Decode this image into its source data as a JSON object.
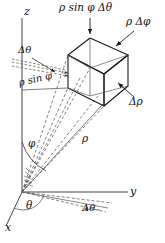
{
  "figure": {
    "type": "spherical-coordinates-volume-element",
    "background_color": "#ffffff",
    "stroke_color": "#1a1a1a",
    "dashed_color": "#555555"
  },
  "axes": {
    "z_label": "z",
    "y_label": "y",
    "x_label": "x"
  },
  "labels": {
    "arc_rho_sin_phi_dtheta": "ρ sin φ Δθ",
    "edge_rho_dphi": "ρ Δφ",
    "edge_drho": "Δρ",
    "angle_dtheta_upper": "Δθ",
    "segment_rho_sin_phi": "ρ sin φ",
    "ray_rho": "ρ",
    "angle_phi": "φ",
    "angle_theta": "θ",
    "angle_dtheta_lower": "Δθ"
  },
  "symbols": {
    "rho": "ρ",
    "phi": "φ",
    "theta": "θ",
    "delta": "Δ"
  },
  "geometry": {
    "origin": [
      22,
      192
    ],
    "z_axis_top": [
      22,
      18
    ],
    "y_axis_end": [
      128,
      192
    ],
    "x_axis_end": [
      6,
      226
    ],
    "box_vertices": {
      "top_back": [
        90,
        38
      ],
      "top_left": [
        68,
        55
      ],
      "top_right": [
        128,
        55
      ],
      "top_front": [
        104,
        74
      ],
      "bottom_left": [
        68,
        88
      ],
      "bottom_front": [
        104,
        106
      ],
      "bottom_right": [
        128,
        86
      ],
      "bottom_back": [
        90,
        68
      ]
    }
  }
}
